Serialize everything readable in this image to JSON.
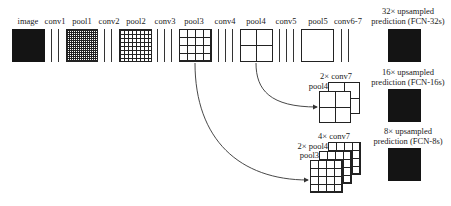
{
  "diagram": {
    "pipeline": [
      {
        "id": "image",
        "label": "image",
        "kind": "block",
        "cells": 32,
        "fill": "dark"
      },
      {
        "id": "conv1",
        "label": "conv1",
        "kind": "lines",
        "count": 2
      },
      {
        "id": "pool1",
        "label": "pool1",
        "kind": "block",
        "cells": 16
      },
      {
        "id": "conv2",
        "label": "conv2",
        "kind": "lines",
        "count": 2
      },
      {
        "id": "pool2",
        "label": "pool2",
        "kind": "block",
        "cells": 8
      },
      {
        "id": "conv3",
        "label": "conv3",
        "kind": "lines",
        "count": 3
      },
      {
        "id": "pool3",
        "label": "pool3",
        "kind": "block",
        "cells": 4
      },
      {
        "id": "conv4",
        "label": "conv4",
        "kind": "lines",
        "count": 3
      },
      {
        "id": "pool4",
        "label": "pool4",
        "kind": "block",
        "cells": 2
      },
      {
        "id": "conv5",
        "label": "conv5",
        "kind": "lines",
        "count": 3
      },
      {
        "id": "pool5",
        "label": "pool5",
        "kind": "block",
        "cells": 1
      },
      {
        "id": "conv6_7",
        "label": "conv6-7",
        "kind": "lines",
        "count": 2
      }
    ],
    "fusion_16s": {
      "labels": {
        "top": "2× conv7",
        "front": "pool4"
      },
      "cells": 2
    },
    "fusion_8s": {
      "labels": {
        "top": "4× conv7",
        "middle": "2× pool4",
        "front": "pool3"
      },
      "cells": 4
    },
    "predictions": [
      {
        "id": "fcn32s",
        "line1": "32× upsampled",
        "line2": "prediction (FCN-32s)"
      },
      {
        "id": "fcn16s",
        "line1": "16× upsampled",
        "line2": "prediction (FCN-16s)"
      },
      {
        "id": "fcn8s",
        "line1": "8× upsampled",
        "line2": "prediction (FCN-8s)"
      }
    ],
    "colors": {
      "ink": "#222222",
      "prediction_fill": "#141414",
      "background": "#ffffff"
    }
  }
}
